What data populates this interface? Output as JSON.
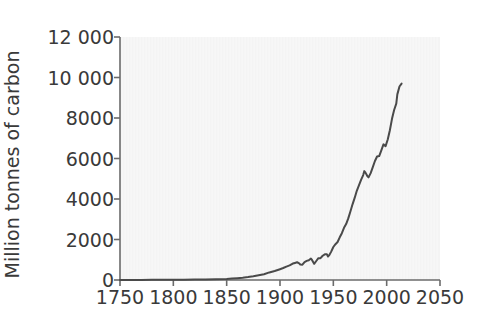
{
  "chart_data": {
    "type": "line",
    "title": "",
    "subtitle": "",
    "xlabel": "",
    "ylabel": "Million tonnes of carbon",
    "xlim": [
      1750,
      2050
    ],
    "ylim": [
      0,
      12000
    ],
    "grid": false,
    "legend": false,
    "legend_position": "none",
    "line_color": "#4a4a4a",
    "plot_bg_color": "#f4f4f4",
    "text_color": "#3a3a3a",
    "xticks": [
      1750,
      1800,
      1850,
      1900,
      1950,
      2000,
      2050
    ],
    "xtick_labels": [
      "1750",
      "1800",
      "1850",
      "1900",
      "1950",
      "2000",
      "2050"
    ],
    "yticks": [
      0,
      2000,
      4000,
      6000,
      8000,
      10000,
      12000
    ],
    "ytick_labels": [
      "0",
      "2000",
      "4000",
      "6000",
      "8000",
      "10 000",
      "12 000"
    ],
    "series": [
      {
        "name": "Global carbon emissions from fossil fuels",
        "x": [
          1750,
          1760,
          1770,
          1780,
          1790,
          1800,
          1810,
          1820,
          1830,
          1840,
          1850,
          1855,
          1860,
          1865,
          1870,
          1875,
          1880,
          1885,
          1890,
          1895,
          1900,
          1903,
          1906,
          1909,
          1912,
          1914,
          1916,
          1918,
          1919,
          1921,
          1923,
          1925,
          1927,
          1929,
          1930,
          1932,
          1934,
          1936,
          1938,
          1940,
          1942,
          1944,
          1945,
          1946,
          1948,
          1950,
          1952,
          1954,
          1956,
          1958,
          1960,
          1962,
          1964,
          1966,
          1968,
          1970,
          1972,
          1974,
          1976,
          1978,
          1979,
          1980,
          1982,
          1983,
          1985,
          1987,
          1989,
          1991,
          1993,
          1995,
          1997,
          1999,
          2001,
          2003,
          2005,
          2007,
          2009,
          2010,
          2012,
          2014
        ],
        "y": [
          3,
          4,
          5,
          7,
          9,
          11,
          14,
          19,
          27,
          40,
          54,
          70,
          91,
          116,
          147,
          184,
          236,
          287,
          375,
          442,
          534,
          591,
          663,
          722,
          812,
          843,
          876,
          821,
          765,
          756,
          887,
          946,
          978,
          1060,
          990,
          800,
          939,
          1078,
          1080,
          1199,
          1269,
          1268,
          1160,
          1215,
          1401,
          1630,
          1767,
          1876,
          2107,
          2309,
          2577,
          2760,
          3043,
          3380,
          3738,
          4053,
          4406,
          4668,
          4947,
          5181,
          5376,
          5316,
          5120,
          5069,
          5277,
          5576,
          5878,
          6098,
          6122,
          6404,
          6698,
          6609,
          6939,
          7397,
          7960,
          8395,
          8712,
          9167,
          9557,
          9700
        ]
      }
    ],
    "annotations": []
  },
  "axes": {
    "plot_left_px": 120,
    "plot_right_px": 440,
    "plot_top_px": 37,
    "plot_bottom_px": 280
  }
}
